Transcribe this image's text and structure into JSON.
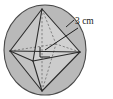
{
  "figure": {
    "shape": "sphere",
    "inscribed_solid": "octahedron",
    "labels": [
      {
        "id": "radius-label",
        "text": "3 cm",
        "points_to": "sphere-radius",
        "x": 74,
        "y": 22
      }
    ],
    "markers": [
      {
        "id": "right-angle-marker",
        "kind": "right-angle-square",
        "x": 44,
        "y": 52
      }
    ],
    "colors": {
      "sphere_fill": "#b9b9b9",
      "sphere_stroke": "#4a4a4a",
      "solid_fill_light": "#cfcfcf",
      "solid_fill_mid": "#bdbdbd",
      "edge_stroke": "#2b2b2b",
      "hidden_edge_stroke": "#6e6e6e",
      "leader_stroke": "#1a1a1a",
      "text": "#1a1a1a",
      "background": "#ffffff"
    },
    "geometry": {
      "sphere_center": {
        "x": 45,
        "y": 50
      },
      "sphere_rx": 41,
      "sphere_ry": 45,
      "vertices": {
        "top": {
          "x": 42,
          "y": 9
        },
        "bottom": {
          "x": 42,
          "y": 91
        },
        "left": {
          "x": 10,
          "y": 51
        },
        "right": {
          "x": 80,
          "y": 52
        },
        "front": {
          "x": 33,
          "y": 61
        },
        "back": {
          "x": 56,
          "y": 44
        }
      },
      "radius_line": {
        "from": {
          "x": 45,
          "y": 50
        },
        "to": {
          "x": 78,
          "y": 28
        }
      }
    }
  }
}
